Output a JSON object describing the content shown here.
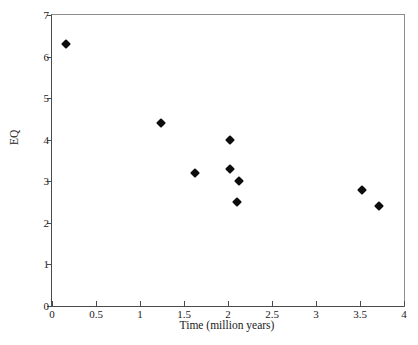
{
  "chart_data": {
    "type": "scatter",
    "title": "",
    "xlabel": "Time (million years)",
    "ylabel": "EQ",
    "xlim": [
      0,
      4
    ],
    "ylim": [
      0,
      7
    ],
    "grid": false,
    "legend": null,
    "marker": "filled-diamond",
    "marker_color": "#0d0d0d",
    "xticks": [
      {
        "value": 0,
        "label": "0"
      },
      {
        "value": 0.5,
        "label": "0.5"
      },
      {
        "value": 1,
        "label": "1"
      },
      {
        "value": 1.5,
        "label": "1.5"
      },
      {
        "value": 2,
        "label": "2"
      },
      {
        "value": 2.5,
        "label": "2.5"
      },
      {
        "value": 3,
        "label": "3"
      },
      {
        "value": 3.5,
        "label": "3.5"
      },
      {
        "value": 4,
        "label": "4"
      }
    ],
    "yticks": [
      {
        "value": 0,
        "label": "0"
      },
      {
        "value": 1,
        "label": "1"
      },
      {
        "value": 2,
        "label": "2"
      },
      {
        "value": 3,
        "label": "3"
      },
      {
        "value": 4,
        "label": "4"
      },
      {
        "value": 5,
        "label": "5"
      },
      {
        "value": 6,
        "label": "6"
      },
      {
        "value": 7,
        "label": "7"
      }
    ],
    "points": [
      {
        "x": 0.16,
        "y": 6.3
      },
      {
        "x": 1.24,
        "y": 4.4
      },
      {
        "x": 1.62,
        "y": 3.2
      },
      {
        "x": 2.02,
        "y": 4.0
      },
      {
        "x": 2.02,
        "y": 3.3
      },
      {
        "x": 2.12,
        "y": 3.0
      },
      {
        "x": 2.1,
        "y": 2.5
      },
      {
        "x": 3.52,
        "y": 2.8
      },
      {
        "x": 3.72,
        "y": 2.4
      }
    ]
  }
}
